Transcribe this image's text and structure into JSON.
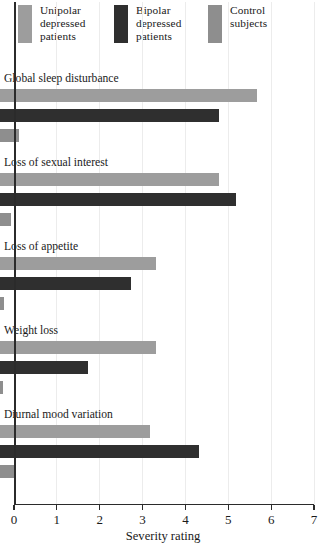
{
  "chart_data": {
    "type": "bar",
    "orientation": "horizontal",
    "title": "",
    "xlabel": "Severity rating",
    "ylabel": "",
    "xlim": [
      0,
      7
    ],
    "xticks": [
      0,
      1,
      2,
      3,
      4,
      5,
      6,
      7
    ],
    "grid": true,
    "legend_position": "top",
    "categories": [
      "Global sleep disturbance",
      "Loss of sexual interest",
      "Loss of appetite",
      "Weight loss",
      "Diurnal mood variation"
    ],
    "series": [
      {
        "name": "Unipolar depressed patients",
        "color": "#9d9d9d",
        "values": [
          6.0,
          5.1,
          3.65,
          3.65,
          3.5
        ]
      },
      {
        "name": "Bipolar depressed patients",
        "color": "#2f2f2f",
        "values": [
          5.1,
          5.5,
          3.05,
          2.05,
          4.65
        ]
      },
      {
        "name": "Control subjects",
        "color": "#8e8e8e",
        "values": [
          0.45,
          0.25,
          0.1,
          0.08,
          0.38
        ]
      }
    ]
  },
  "legend": {
    "items": [
      {
        "lines": [
          "Unipolar",
          "depressed",
          "patients"
        ],
        "color": "#9d9d9d"
      },
      {
        "lines": [
          "Bipolar",
          "depressed",
          "patients"
        ],
        "color": "#2f2f2f"
      },
      {
        "lines": [
          "Control",
          "subjects"
        ],
        "color": "#8e8e8e"
      }
    ]
  },
  "axis": {
    "x_title": "Severity rating",
    "x_tick_labels": [
      "0",
      "1",
      "2",
      "3",
      "4",
      "5",
      "6",
      "7"
    ]
  }
}
